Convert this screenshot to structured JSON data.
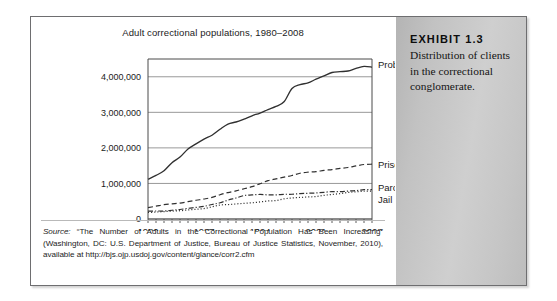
{
  "exhibit": {
    "number_label": "EXHIBIT 1.3",
    "caption": "Distribution of clients in the correctional conglomerate."
  },
  "figure": {
    "title": "Adult correctional populations, 1980–2008",
    "source_label": "Source:",
    "source_text": " “The Number of Adults in the Correctional Population Has Been Increasing” (Washington, DC: U.S. Department of Justice, Bureau of Justice Statistics, November, 2010), available at http://bjs.ojp.usdoj.gov/content/glance/corr2.cfm"
  },
  "chart_data": {
    "type": "line",
    "title": "Adult correctional populations, 1980–2008",
    "xlabel": "",
    "ylabel": "",
    "xlim": [
      1980,
      2008
    ],
    "ylim": [
      0,
      4500000
    ],
    "grid": true,
    "grid_axis": "y",
    "legend_position": "right-inline-labels",
    "x_tick_labels": [
      "1980",
      "1987",
      "1994",
      "2001",
      "2008"
    ],
    "x_tick_values": [
      1980,
      1987,
      1994,
      2001,
      2008
    ],
    "x_minor_ticks_every": 1,
    "y_tick_labels": [
      "0",
      "1,000,000",
      "2,000,000",
      "3,000,000",
      "4,000,000"
    ],
    "y_tick_values": [
      0,
      1000000,
      2000000,
      3000000,
      4000000
    ],
    "x": [
      1980,
      1981,
      1982,
      1983,
      1984,
      1985,
      1986,
      1987,
      1988,
      1989,
      1990,
      1991,
      1992,
      1993,
      1994,
      1995,
      1996,
      1997,
      1998,
      1999,
      2000,
      2001,
      2002,
      2003,
      2004,
      2005,
      2006,
      2007,
      2008
    ],
    "series": [
      {
        "name": "Probation",
        "line_style": "solid",
        "color": "#303030",
        "values": [
          1118097,
          1225934,
          1357264,
          1582947,
          1740948,
          1968712,
          2114621,
          2247158,
          2356483,
          2522125,
          2670234,
          2728472,
          2811611,
          2903061,
          2981022,
          3077861,
          3164996,
          3296513,
          3670441,
          3779922,
          3826209,
          3931731,
          4024067,
          4120012,
          4143792,
          4162536,
          4236800,
          4293163,
          4270917
        ]
      },
      {
        "name": "Prison",
        "line_style": "dashed",
        "color": "#303030",
        "values": [
          319598,
          360029,
          402914,
          423898,
          448264,
          487593,
          526436,
          562814,
          607766,
          683367,
          743382,
          792535,
          850566,
          909381,
          990147,
          1078542,
          1127528,
          1176564,
          1224469,
          1287172,
          1316333,
          1330980,
          1367547,
          1390279,
          1421345,
          1448344,
          1492973,
          1532817,
          1540805
        ]
      },
      {
        "name": "Parole",
        "line_style": "dashdot",
        "color": "#303030",
        "values": [
          220438,
          225539,
          224604,
          246440,
          266992,
          300203,
          325638,
          355505,
          407977,
          456803,
          531407,
          590442,
          658601,
          676100,
          690371,
          679421,
          679733,
          694787,
          696385,
          714457,
          723898,
          732333,
          750934,
          769925,
          771852,
          784408,
          798202,
          826097,
          828169
        ]
      },
      {
        "name": "Jail",
        "line_style": "dotted",
        "color": "#303030",
        "values": [
          182288,
          195085,
          207853,
          221815,
          233018,
          254986,
          272736,
          294092,
          341893,
          393303,
          405320,
          424129,
          441781,
          455500,
          479800,
          507044,
          518492,
          567079,
          592462,
          605943,
          621149,
          631240,
          665475,
          691301,
          713990,
          747529,
          765819,
          780581,
          785556
        ]
      }
    ],
    "series_labels": [
      "Probation",
      "Prison",
      "Parole",
      "Jail"
    ]
  }
}
